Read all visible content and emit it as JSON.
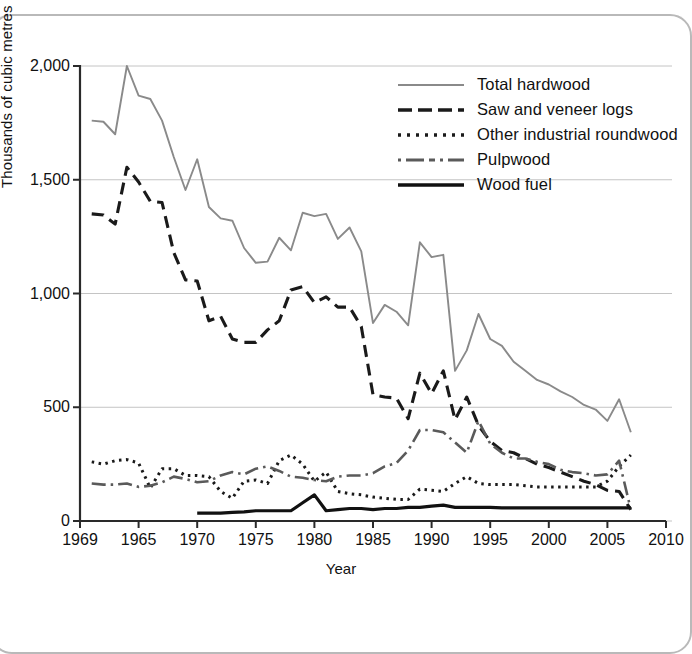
{
  "axes": {
    "ylabel": "Thousands of cubic metres",
    "xlabel": "Year",
    "yticks": [
      "0",
      "500",
      "1,000",
      "1,500",
      "2,000"
    ],
    "xticks": [
      "1969",
      "1965",
      "1970",
      "1975",
      "1980",
      "1985",
      "1990",
      "1995",
      "2000",
      "2005",
      "2010"
    ]
  },
  "legend": {
    "items": [
      {
        "label": "Total hardwood",
        "style": "solid-gray",
        "color": "#8a8a8a"
      },
      {
        "label": "Saw and veneer logs",
        "style": "long-dash",
        "color": "#1a1a1a"
      },
      {
        "label": "Other industrial roundwood",
        "style": "dotted",
        "color": "#1a1a1a"
      },
      {
        "label": "Pulpwood",
        "style": "dash-dot",
        "color": "#5a5a5a"
      },
      {
        "label": "Wood fuel",
        "style": "solid-black",
        "color": "#111111"
      }
    ]
  },
  "chart_data": {
    "type": "line",
    "title": "",
    "xlabel": "Year",
    "ylabel": "Thousands of cubic metres",
    "xlim": [
      1960,
      2010
    ],
    "ylim": [
      0,
      2000
    ],
    "ytick_values": [
      0,
      500,
      1000,
      1500,
      2000
    ],
    "xtick_values": [
      1960,
      1965,
      1970,
      1975,
      1980,
      1985,
      1990,
      1995,
      2000,
      2005,
      2010
    ],
    "xtick_labels": [
      "1969",
      "1965",
      "1970",
      "1975",
      "1980",
      "1985",
      "1990",
      "1995",
      "2000",
      "2005",
      "2010"
    ],
    "grid": "horizontal",
    "legend_position": "upper right",
    "series": [
      {
        "name": "Total hardwood",
        "color": "#8a8a8a",
        "dash": "none",
        "x": [
          1961,
          1962,
          1963,
          1964,
          1965,
          1966,
          1967,
          1968,
          1969,
          1970,
          1971,
          1972,
          1973,
          1974,
          1975,
          1976,
          1977,
          1978,
          1979,
          1980,
          1981,
          1982,
          1983,
          1984,
          1985,
          1986,
          1987,
          1988,
          1989,
          1990,
          1991,
          1992,
          1993,
          1994,
          1995,
          1996,
          1997,
          1998,
          1999,
          2000,
          2001,
          2002,
          2003,
          2004,
          2005,
          2006,
          2007
        ],
        "y": [
          1760,
          1755,
          1700,
          2000,
          1870,
          1855,
          1760,
          1600,
          1455,
          1590,
          1380,
          1330,
          1320,
          1200,
          1135,
          1140,
          1245,
          1190,
          1355,
          1340,
          1350,
          1240,
          1290,
          1185,
          870,
          950,
          920,
          860,
          1225,
          1160,
          1170,
          660,
          750,
          910,
          800,
          770,
          700,
          660,
          620,
          600,
          570,
          545,
          510,
          490,
          440,
          535,
          390
        ]
      },
      {
        "name": "Saw and veneer logs",
        "color": "#1a1a1a",
        "dash": "long-dash",
        "x": [
          1961,
          1962,
          1963,
          1964,
          1965,
          1966,
          1967,
          1968,
          1969,
          1970,
          1971,
          1972,
          1973,
          1974,
          1975,
          1976,
          1977,
          1978,
          1979,
          1980,
          1981,
          1982,
          1983,
          1984,
          1985,
          1986,
          1987,
          1988,
          1989,
          1990,
          1991,
          1992,
          1993,
          1994,
          1995,
          1996,
          1997,
          1998,
          1999,
          2000,
          2001,
          2002,
          2003,
          2004,
          2005,
          2006,
          2007
        ],
        "y": [
          1350,
          1345,
          1305,
          1555,
          1490,
          1405,
          1400,
          1180,
          1060,
          1055,
          880,
          900,
          800,
          785,
          785,
          840,
          880,
          1015,
          1030,
          960,
          985,
          940,
          940,
          855,
          555,
          545,
          540,
          450,
          650,
          560,
          660,
          445,
          545,
          420,
          350,
          310,
          300,
          275,
          250,
          235,
          215,
          195,
          175,
          160,
          135,
          130,
          50
        ]
      },
      {
        "name": "Other industrial roundwood",
        "color": "#1a1a1a",
        "dash": "dotted",
        "x": [
          1961,
          1962,
          1963,
          1964,
          1965,
          1966,
          1967,
          1968,
          1969,
          1970,
          1971,
          1972,
          1973,
          1974,
          1975,
          1976,
          1977,
          1978,
          1979,
          1980,
          1981,
          1982,
          1983,
          1984,
          1985,
          1986,
          1987,
          1988,
          1989,
          1990,
          1991,
          1992,
          1993,
          1994,
          1995,
          1996,
          1997,
          1998,
          1999,
          2000,
          2001,
          2002,
          2003,
          2004,
          2005,
          2006,
          2007
        ],
        "y": [
          260,
          250,
          265,
          270,
          255,
          145,
          230,
          230,
          200,
          200,
          195,
          130,
          100,
          175,
          180,
          165,
          265,
          290,
          250,
          175,
          215,
          130,
          120,
          115,
          105,
          100,
          95,
          95,
          140,
          135,
          130,
          165,
          195,
          165,
          160,
          160,
          160,
          155,
          150,
          150,
          150,
          150,
          150,
          150,
          175,
          240,
          290
        ]
      },
      {
        "name": "Pulpwood",
        "color": "#5a5a5a",
        "dash": "dash-dot",
        "x": [
          1961,
          1962,
          1963,
          1964,
          1965,
          1966,
          1967,
          1968,
          1969,
          1970,
          1971,
          1972,
          1973,
          1974,
          1975,
          1976,
          1977,
          1978,
          1979,
          1980,
          1981,
          1982,
          1983,
          1984,
          1985,
          1986,
          1987,
          1988,
          1989,
          1990,
          1991,
          1992,
          1993,
          1994,
          1995,
          1996,
          1997,
          1998,
          1999,
          2000,
          2001,
          2002,
          2003,
          2004,
          2005,
          2006,
          2007
        ],
        "y": [
          165,
          160,
          160,
          165,
          150,
          155,
          170,
          195,
          185,
          170,
          175,
          200,
          215,
          205,
          230,
          240,
          220,
          195,
          190,
          180,
          175,
          195,
          200,
          200,
          210,
          240,
          255,
          310,
          400,
          400,
          390,
          345,
          300,
          440,
          340,
          300,
          275,
          275,
          260,
          250,
          225,
          215,
          210,
          200,
          205,
          265,
          50
        ]
      },
      {
        "name": "Wood fuel",
        "color": "#111111",
        "dash": "none",
        "x": [
          1970,
          1971,
          1972,
          1973,
          1974,
          1975,
          1976,
          1977,
          1978,
          1979,
          1980,
          1981,
          1982,
          1983,
          1984,
          1985,
          1986,
          1987,
          1988,
          1989,
          1990,
          1991,
          1992,
          1993,
          1994,
          1995,
          1996,
          1997,
          1998,
          1999,
          2000,
          2001,
          2002,
          2003,
          2004,
          2005,
          2006,
          2007
        ],
        "y": [
          35,
          35,
          35,
          38,
          40,
          45,
          45,
          45,
          45,
          80,
          115,
          45,
          50,
          55,
          55,
          50,
          55,
          55,
          60,
          60,
          65,
          70,
          60,
          60,
          60,
          60,
          58,
          58,
          58,
          58,
          58,
          58,
          58,
          58,
          58,
          58,
          58,
          58
        ]
      }
    ]
  }
}
